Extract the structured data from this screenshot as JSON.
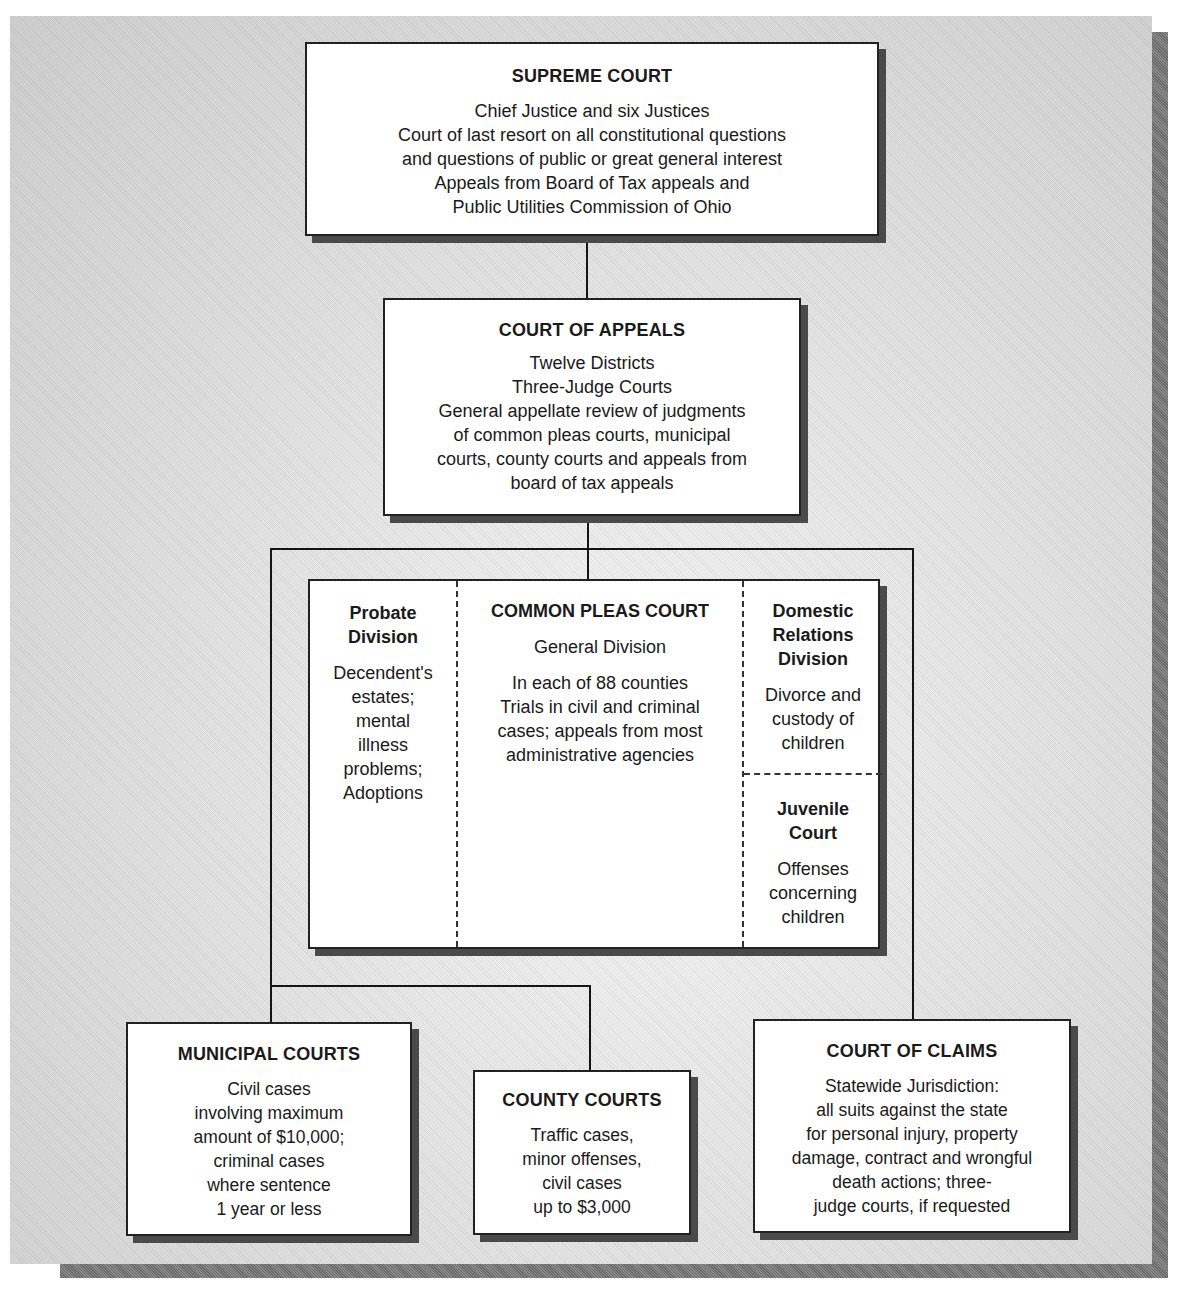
{
  "diagram": {
    "type": "org-chart",
    "supreme_court": {
      "title": "SUPREME COURT",
      "lines": [
        "Chief Justice and six Justices",
        "Court of last resort on all constitutional questions",
        "and questions of public or great general interest",
        "Appeals from Board of Tax appeals and",
        "Public Utilities Commission of Ohio"
      ]
    },
    "court_of_appeals": {
      "title": "COURT OF APPEALS",
      "lines": [
        "Twelve Districts",
        "Three-Judge Courts",
        "General appellate review of judgments",
        "of common pleas courts, municipal",
        "courts, county courts and appeals from",
        "board of tax appeals"
      ]
    },
    "common_pleas": {
      "probate": {
        "title_lines": [
          "Probate",
          "Division"
        ],
        "lines": [
          "Decendent's",
          "estates;",
          "mental",
          "illness",
          "problems;",
          "Adoptions"
        ]
      },
      "general": {
        "title": "COMMON PLEAS COURT",
        "subtitle": "General Division",
        "lines": [
          "In each of 88 counties",
          "Trials in civil and criminal",
          "cases; appeals from most",
          "administrative agencies"
        ]
      },
      "domestic": {
        "title_lines": [
          "Domestic",
          "Relations",
          "Division"
        ],
        "lines": [
          "Divorce and",
          "custody of",
          "children"
        ]
      },
      "juvenile": {
        "title_lines": [
          "Juvenile",
          "Court"
        ],
        "lines": [
          "Offenses",
          "concerning",
          "children"
        ]
      }
    },
    "municipal_courts": {
      "title": "MUNICIPAL COURTS",
      "lines": [
        "Civil cases",
        "involving maximum",
        "amount of $10,000;",
        "criminal cases",
        "where sentence",
        "1 year or less"
      ]
    },
    "county_courts": {
      "title": "COUNTY COURTS",
      "lines": [
        "Traffic cases,",
        "minor offenses,",
        "civil cases",
        "up to $3,000"
      ]
    },
    "court_of_claims": {
      "title": "COURT OF CLAIMS",
      "lines": [
        "Statewide Jurisdiction:",
        "all suits against the state",
        "for personal injury, property",
        "damage, contract and wrongful",
        "death actions; three-",
        "judge courts, if requested"
      ]
    },
    "edges": [
      [
        "SUPREME COURT",
        "COURT OF APPEALS"
      ],
      [
        "COURT OF APPEALS",
        "COMMON PLEAS COURT"
      ],
      [
        "COURT OF APPEALS",
        "MUNICIPAL COURTS"
      ],
      [
        "COURT OF APPEALS",
        "COUNTY COURTS"
      ],
      [
        "COURT OF APPEALS",
        "COURT OF CLAIMS"
      ]
    ]
  }
}
